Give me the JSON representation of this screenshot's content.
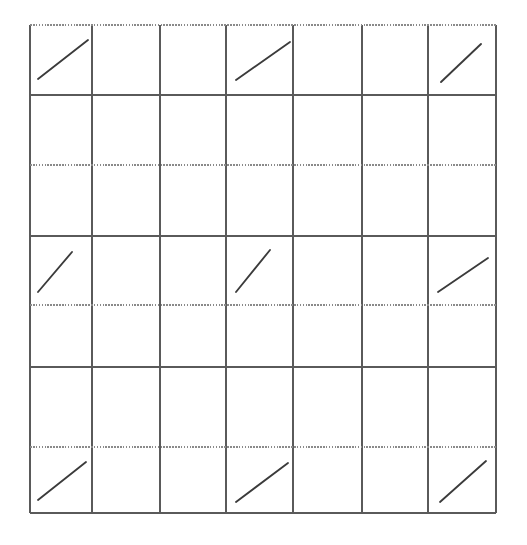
{
  "figure": {
    "type": "diagram",
    "width": 527,
    "height": 545,
    "background_color": "#ffffff"
  },
  "grid": {
    "columns": 7,
    "rows": 7,
    "column_edges_px": [
      30,
      92,
      160,
      226,
      293,
      362,
      428,
      496
    ],
    "row_edges_px": [
      25,
      95,
      165,
      236,
      305,
      367,
      447,
      513
    ],
    "solid_line_color": "#5a5a5a",
    "dotted_line_color": "#8a8a8a",
    "faint_line_color": "#a9a9a9",
    "vertical_line_styles": [
      "solid",
      "solid",
      "solid",
      "solid",
      "solid",
      "solid",
      "solid",
      "solid"
    ],
    "horizontal_line_styles": [
      "dotted",
      "solid",
      "dotted",
      "solid",
      "dotted",
      "solid",
      "dotted",
      "solid"
    ]
  },
  "strokes": {
    "color": "#3b3b3b",
    "width_px": 1.85,
    "direction": "lower-left-to-upper-right",
    "count": 9,
    "occupied_cells": [
      {
        "row": 1,
        "col": 1
      },
      {
        "row": 1,
        "col": 4
      },
      {
        "row": 1,
        "col": 7
      },
      {
        "row": 4,
        "col": 1
      },
      {
        "row": 4,
        "col": 4
      },
      {
        "row": 4,
        "col": 7
      },
      {
        "row": 7,
        "col": 1
      },
      {
        "row": 7,
        "col": 4
      },
      {
        "row": 7,
        "col": 7
      }
    ],
    "segments": [
      {
        "name": "stroke-r1c1",
        "row": 1,
        "col": 1,
        "x1": 38,
        "y1": 79,
        "x2": 88,
        "y2": 40
      },
      {
        "name": "stroke-r1c4",
        "row": 1,
        "col": 4,
        "x1": 236,
        "y1": 80,
        "x2": 290,
        "y2": 42
      },
      {
        "name": "stroke-r1c7",
        "row": 1,
        "col": 7,
        "x1": 441,
        "y1": 82,
        "x2": 481,
        "y2": 44
      },
      {
        "name": "stroke-r4c1",
        "row": 4,
        "col": 1,
        "x1": 38,
        "y1": 292,
        "x2": 72,
        "y2": 252
      },
      {
        "name": "stroke-r4c4",
        "row": 4,
        "col": 4,
        "x1": 236,
        "y1": 292,
        "x2": 270,
        "y2": 250
      },
      {
        "name": "stroke-r4c7",
        "row": 4,
        "col": 7,
        "x1": 438,
        "y1": 292,
        "x2": 488,
        "y2": 258
      },
      {
        "name": "stroke-r7c1",
        "row": 7,
        "col": 1,
        "x1": 38,
        "y1": 500,
        "x2": 86,
        "y2": 462
      },
      {
        "name": "stroke-r7c4",
        "row": 7,
        "col": 4,
        "x1": 236,
        "y1": 502,
        "x2": 288,
        "y2": 463
      },
      {
        "name": "stroke-r7c7",
        "row": 7,
        "col": 7,
        "x1": 440,
        "y1": 502,
        "x2": 486,
        "y2": 461
      }
    ]
  },
  "chart_data": {
    "type": "heatmap",
    "title": "",
    "subtitle": "",
    "xlabel": "",
    "ylabel": "",
    "categories_x": [
      "1",
      "2",
      "3",
      "4",
      "5",
      "6",
      "7"
    ],
    "categories_y": [
      "1",
      "2",
      "3",
      "4",
      "5",
      "6",
      "7"
    ],
    "legend": [],
    "grid": true,
    "values": [
      [
        1,
        0,
        0,
        1,
        0,
        0,
        1
      ],
      [
        0,
        0,
        0,
        0,
        0,
        0,
        0
      ],
      [
        0,
        0,
        0,
        0,
        0,
        0,
        0
      ],
      [
        1,
        0,
        0,
        1,
        0,
        0,
        1
      ],
      [
        0,
        0,
        0,
        0,
        0,
        0,
        0
      ],
      [
        0,
        0,
        0,
        0,
        0,
        0,
        0
      ],
      [
        1,
        0,
        0,
        1,
        0,
        0,
        1
      ]
    ],
    "value_meaning": "1 = cell contains a diagonal stroke mark, 0 = empty cell",
    "annotations": []
  }
}
